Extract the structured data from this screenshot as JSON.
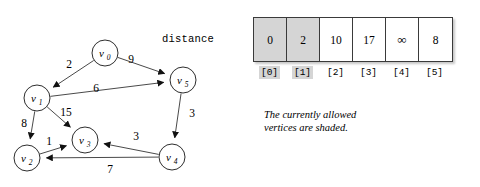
{
  "figure": {
    "distance_label": "distance",
    "caption_line1": "The currently allowed",
    "caption_line2": "vertices are shaded."
  },
  "array": {
    "name": "distance",
    "cells": [
      {
        "value": "0",
        "index": "[0]",
        "shaded": true
      },
      {
        "value": "2",
        "index": "[1]",
        "shaded": true
      },
      {
        "value": "10",
        "index": "[2]",
        "shaded": false
      },
      {
        "value": "17",
        "index": "[3]",
        "shaded": false
      },
      {
        "value": "∞",
        "index": "[4]",
        "shaded": false
      },
      {
        "value": "8",
        "index": "[5]",
        "shaded": false
      }
    ]
  },
  "graph": {
    "type": "directed-weighted-graph",
    "nodes": [
      {
        "id": "v0",
        "base": "v",
        "sub": "0",
        "cx": 105,
        "cy": 53,
        "r": 13
      },
      {
        "id": "v1",
        "base": "v",
        "sub": "1",
        "cx": 37,
        "cy": 98,
        "r": 13
      },
      {
        "id": "v2",
        "base": "v",
        "sub": "2",
        "cx": 27,
        "cy": 158,
        "r": 13
      },
      {
        "id": "v3",
        "base": "v",
        "sub": "3",
        "cx": 85,
        "cy": 140,
        "r": 13
      },
      {
        "id": "v4",
        "base": "v",
        "sub": "4",
        "cx": 172,
        "cy": 157,
        "r": 13
      },
      {
        "id": "v5",
        "base": "v",
        "sub": "5",
        "cx": 183,
        "cy": 80,
        "r": 13
      }
    ],
    "edges": [
      {
        "from": "v0",
        "to": "v1",
        "weight": "2",
        "lx": 69,
        "ly": 68
      },
      {
        "from": "v0",
        "to": "v5",
        "weight": "9",
        "lx": 131,
        "ly": 63
      },
      {
        "from": "v1",
        "to": "v5",
        "weight": "6",
        "lx": 96,
        "ly": 92
      },
      {
        "from": "v1",
        "to": "v3",
        "weight": "15",
        "lx": 66,
        "ly": 116
      },
      {
        "from": "v1",
        "to": "v2",
        "weight": "8",
        "lx": 24,
        "ly": 127
      },
      {
        "from": "v2",
        "to": "v3",
        "weight": "1",
        "lx": 49,
        "ly": 145
      },
      {
        "from": "v4",
        "to": "v3",
        "weight": "3",
        "lx": 136,
        "ly": 140
      },
      {
        "from": "v4",
        "to": "v2",
        "weight": "7",
        "lx": 110,
        "ly": 173
      },
      {
        "from": "v5",
        "to": "v4",
        "weight": "3",
        "lx": 192,
        "ly": 117
      }
    ]
  },
  "colors": {
    "shade": "#d5d5d5",
    "stroke": "#3a3a3a",
    "text": "#000000"
  }
}
